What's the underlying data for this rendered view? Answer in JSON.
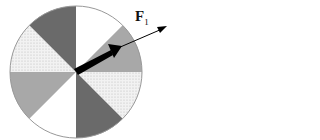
{
  "diagram": {
    "type": "sectored-disk-with-force-vector",
    "center": [
      76,
      72
    ],
    "radius": 66,
    "sectors": [
      {
        "start_deg": 0,
        "end_deg": 45,
        "fill": "white"
      },
      {
        "start_deg": 45,
        "end_deg": 90,
        "fill": "medium-gray"
      },
      {
        "start_deg": 90,
        "end_deg": 135,
        "fill": "light-dotted"
      },
      {
        "start_deg": 135,
        "end_deg": 180,
        "fill": "dark-gray"
      },
      {
        "start_deg": 180,
        "end_deg": 225,
        "fill": "white"
      },
      {
        "start_deg": 225,
        "end_deg": 270,
        "fill": "medium-gray"
      },
      {
        "start_deg": 270,
        "end_deg": 315,
        "fill": "light-dotted"
      },
      {
        "start_deg": 315,
        "end_deg": 360,
        "fill": "dark-gray"
      }
    ],
    "colors": {
      "white": "#ffffff",
      "medium-gray": "#a8a8a8",
      "light-dotted": "#e8e8e8",
      "dark-gray": "#6a6a6a",
      "outline": "#999999",
      "arrow": "#000000"
    },
    "vector": {
      "label_main": "F",
      "label_sub": "1"
    }
  }
}
